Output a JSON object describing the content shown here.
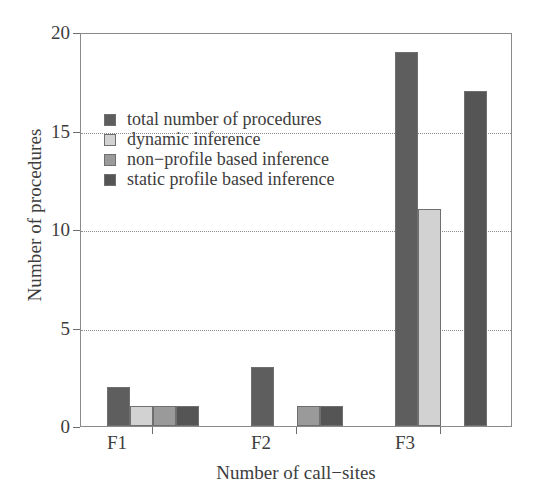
{
  "chart_data": {
    "type": "bar",
    "title": "",
    "xlabel": "Number of call−sites",
    "ylabel": "Number of procedures",
    "categories": [
      "F1",
      "F2",
      "F3"
    ],
    "series": [
      {
        "name": "total number of procedures",
        "values": [
          2,
          3,
          19
        ],
        "color": "#5e5e5e"
      },
      {
        "name": "dynamic inference",
        "values": [
          1,
          0,
          11
        ],
        "color": "#d2d2d2"
      },
      {
        "name": "non−profile based inference",
        "values": [
          1,
          1,
          0
        ],
        "color": "#9a9a9a"
      },
      {
        "name": "static profile based inference",
        "values": [
          1,
          1,
          17
        ],
        "color": "#555555"
      }
    ],
    "ylim": [
      0,
      20
    ],
    "yticks": [
      0,
      5,
      10,
      15,
      20
    ],
    "ytick_labels": [
      "0",
      "5",
      "10",
      "15",
      "20"
    ],
    "gridlines": [
      5,
      10,
      15
    ],
    "grid": true,
    "grid_style": "dotted",
    "legend_position": "upper-left-inside",
    "legend_entries": [
      "total number of procedures",
      "dynamic inference",
      "non−profile based inference",
      "static profile based inference"
    ],
    "bar_outline_color": "#6f6f6f",
    "axis_color": "#8a8a8a"
  }
}
